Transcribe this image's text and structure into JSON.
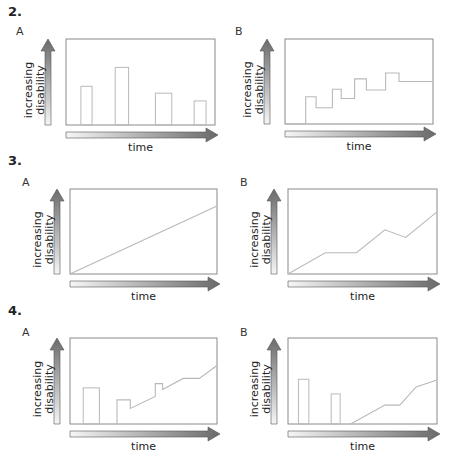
{
  "figures": [
    {
      "number": "2.",
      "panels": [
        {
          "letter": "A",
          "kind": "bars",
          "ylabel_line1": "increasing",
          "ylabel_line2": "disability",
          "xlabel": "time"
        },
        {
          "letter": "B",
          "kind": "line",
          "ylabel_line1": "increasing",
          "ylabel_line2": "disability",
          "xlabel": "time"
        }
      ]
    },
    {
      "number": "3.",
      "panels": [
        {
          "letter": "A",
          "kind": "line",
          "ylabel_line1": "increasing",
          "ylabel_line2": "disability",
          "xlabel": "time"
        },
        {
          "letter": "B",
          "kind": "line",
          "ylabel_line1": "increasing",
          "ylabel_line2": "disability",
          "xlabel": "time"
        }
      ]
    },
    {
      "number": "4.",
      "panels": [
        {
          "letter": "A",
          "kind": "mixed",
          "ylabel_line1": "increasing",
          "ylabel_line2": "disability",
          "xlabel": "time"
        },
        {
          "letter": "B",
          "kind": "mixed",
          "ylabel_line1": "increasing",
          "ylabel_line2": "disability",
          "xlabel": "time"
        }
      ]
    }
  ],
  "colors": {
    "frame": "#8a8a8a",
    "trace": "#b9b9b9",
    "arrow_dark": "#6e6e6e",
    "arrow_light": "#f4f4f4"
  },
  "chart_data": [
    {
      "type": "bar",
      "title": "2A",
      "xlabel": "time",
      "ylabel": "increasing disability",
      "xlim": [
        0,
        1
      ],
      "ylim": [
        0,
        1
      ],
      "bars": [
        {
          "x0": 0.1,
          "x1": 0.175,
          "value": 0.45
        },
        {
          "x0": 0.33,
          "x1": 0.42,
          "value": 0.67
        },
        {
          "x0": 0.6,
          "x1": 0.71,
          "value": 0.37
        },
        {
          "x0": 0.86,
          "x1": 0.94,
          "value": 0.28
        }
      ]
    },
    {
      "type": "line",
      "title": "2B",
      "xlabel": "time",
      "ylabel": "increasing disability",
      "xlim": [
        0,
        1
      ],
      "ylim": [
        0,
        1
      ],
      "points": [
        [
          0,
          0
        ],
        [
          0.14,
          0
        ],
        [
          0.14,
          0.32
        ],
        [
          0.21,
          0.32
        ],
        [
          0.21,
          0.19
        ],
        [
          0.32,
          0.19
        ],
        [
          0.32,
          0.41
        ],
        [
          0.38,
          0.41
        ],
        [
          0.38,
          0.3
        ],
        [
          0.47,
          0.3
        ],
        [
          0.47,
          0.53
        ],
        [
          0.55,
          0.53
        ],
        [
          0.55,
          0.4
        ],
        [
          0.68,
          0.4
        ],
        [
          0.68,
          0.6
        ],
        [
          0.77,
          0.6
        ],
        [
          0.77,
          0.5
        ],
        [
          1.0,
          0.5
        ]
      ]
    },
    {
      "type": "line",
      "title": "3A",
      "xlabel": "time",
      "ylabel": "increasing disability",
      "xlim": [
        0,
        1
      ],
      "ylim": [
        0,
        1
      ],
      "points": [
        [
          0,
          0
        ],
        [
          1.0,
          0.8
        ]
      ]
    },
    {
      "type": "line",
      "title": "3B",
      "xlabel": "time",
      "ylabel": "increasing disability",
      "xlim": [
        0,
        1
      ],
      "ylim": [
        0,
        1
      ],
      "points": [
        [
          0,
          0
        ],
        [
          0.25,
          0.25
        ],
        [
          0.46,
          0.25
        ],
        [
          0.65,
          0.52
        ],
        [
          0.79,
          0.43
        ],
        [
          1.0,
          0.73
        ]
      ]
    },
    {
      "type": "line",
      "title": "4A",
      "xlabel": "time",
      "ylabel": "increasing disability",
      "xlim": [
        0,
        1
      ],
      "ylim": [
        0,
        1
      ],
      "bars": [
        {
          "x0": 0.09,
          "x1": 0.2,
          "value": 0.42
        }
      ],
      "points": [
        [
          0.32,
          0
        ],
        [
          0.32,
          0.28
        ],
        [
          0.41,
          0.28
        ],
        [
          0.41,
          0.18
        ],
        [
          0.58,
          0.32
        ],
        [
          0.58,
          0.47
        ],
        [
          0.63,
          0.47
        ],
        [
          0.63,
          0.4
        ],
        [
          0.77,
          0.53
        ],
        [
          0.88,
          0.53
        ],
        [
          1.0,
          0.68
        ]
      ]
    },
    {
      "type": "line",
      "title": "4B",
      "xlabel": "time",
      "ylabel": "increasing disability",
      "xlim": [
        0,
        1
      ],
      "ylim": [
        0,
        1
      ],
      "bars": [
        {
          "x0": 0.07,
          "x1": 0.14,
          "value": 0.52
        },
        {
          "x0": 0.29,
          "x1": 0.35,
          "value": 0.35
        }
      ],
      "points": [
        [
          0.42,
          0
        ],
        [
          0.65,
          0.22
        ],
        [
          0.75,
          0.22
        ],
        [
          0.86,
          0.43
        ],
        [
          1.0,
          0.51
        ]
      ]
    }
  ]
}
